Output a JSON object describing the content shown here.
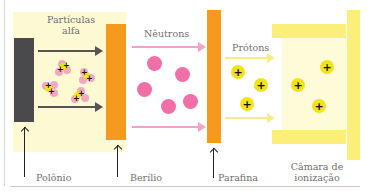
{
  "diagram": {
    "colors": {
      "polonium": "#4a4a4c",
      "beryllium": "#f59a1c",
      "paraffin": "#f59a1c",
      "alpha_zone": "#fdf9d2",
      "alpha_arrow": "#555555",
      "neutron": "#ef6fa6",
      "neutron_arrow": "#f3a3c8",
      "proton_fill": "#f2e21a",
      "proton_arrow": "#f6ec8a",
      "chamber_plate": "#fbef7a",
      "chamber_interior": "#fefbd9",
      "alpha_lobe": "#f0a9c4"
    },
    "labels": {
      "alpha_line1": "Partículas",
      "alpha_line2": "alfa",
      "neutrons": "Nêutrons",
      "protons": "Prótons",
      "polonium": "Polônio",
      "beryllium": "Berílio",
      "paraffin": "Parafina",
      "chamber_line1": "Câmara de",
      "chamber_line2": "ionização"
    },
    "particle_symbol": "+",
    "components": [
      {
        "name": "Polônio",
        "role": "alpha source"
      },
      {
        "name": "Berílio",
        "role": "target emitting neutrons"
      },
      {
        "name": "Parafina",
        "role": "target emitting protons"
      },
      {
        "name": "Câmara de ionização",
        "role": "detector"
      }
    ],
    "flows": [
      {
        "from": "Polônio",
        "to": "Berílio",
        "particle": "Partículas alfa",
        "count_shown": 4
      },
      {
        "from": "Berílio",
        "to": "Parafina",
        "particle": "Nêutrons",
        "count_shown": 5
      },
      {
        "from": "Parafina",
        "to": "Câmara de ionização",
        "particle": "Prótons",
        "count_shown": 6
      }
    ]
  }
}
